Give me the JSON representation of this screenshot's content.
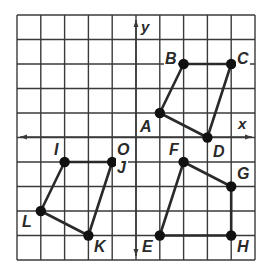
{
  "diagram": {
    "type": "coordinate-grid",
    "grid": {
      "x_min": -5,
      "x_max": 5,
      "y_min": -5,
      "y_max": 5,
      "step": 1
    },
    "axes": {
      "x_label": "x",
      "y_label": "y",
      "origin_label": "O"
    },
    "colors": {
      "grid": "#3a3a3a",
      "axis": "#3a3a3a",
      "shape": "#2a2a2a",
      "point": "#111111",
      "label": "#2a2a2a"
    },
    "shapes": [
      {
        "name": "ABCD",
        "vertices": [
          "A",
          "B",
          "C",
          "D"
        ]
      },
      {
        "name": "IJKL",
        "vertices": [
          "I",
          "J",
          "K",
          "L"
        ]
      },
      {
        "name": "EFGH",
        "vertices": [
          "E",
          "F",
          "G",
          "H"
        ]
      }
    ],
    "points": {
      "A": {
        "label": "A",
        "x": 1,
        "y": 1
      },
      "B": {
        "label": "B",
        "x": 2,
        "y": 3
      },
      "C": {
        "label": "C",
        "x": 4,
        "y": 3
      },
      "D": {
        "label": "D",
        "x": 3,
        "y": 0
      },
      "I": {
        "label": "I",
        "x": -3,
        "y": -1
      },
      "J": {
        "label": "J",
        "x": -1,
        "y": -1
      },
      "K": {
        "label": "K",
        "x": -2,
        "y": -4
      },
      "L": {
        "label": "L",
        "x": -4,
        "y": -3
      },
      "E": {
        "label": "E",
        "x": 1,
        "y": -4
      },
      "F": {
        "label": "F",
        "x": 2,
        "y": -1
      },
      "G": {
        "label": "G",
        "x": 4,
        "y": -2
      },
      "H": {
        "label": "H",
        "x": 4,
        "y": -4
      }
    }
  }
}
